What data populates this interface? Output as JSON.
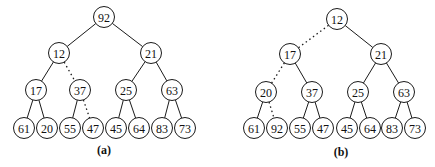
{
  "trees": [
    {
      "id": "a",
      "caption": "(a)",
      "caption_pos": [
        104,
        154
      ],
      "nodes": [
        {
          "value": "92",
          "x": 104,
          "y": 17
        },
        {
          "value": "12",
          "x": 59,
          "y": 53
        },
        {
          "value": "21",
          "x": 151,
          "y": 53
        },
        {
          "value": "17",
          "x": 36,
          "y": 90
        },
        {
          "value": "37",
          "x": 80,
          "y": 90
        },
        {
          "value": "25",
          "x": 126,
          "y": 90
        },
        {
          "value": "63",
          "x": 172,
          "y": 90
        },
        {
          "value": "61",
          "x": 24,
          "y": 128
        },
        {
          "value": "20",
          "x": 47,
          "y": 128
        },
        {
          "value": "55",
          "x": 70,
          "y": 128
        },
        {
          "value": "47",
          "x": 93,
          "y": 128
        },
        {
          "value": "45",
          "x": 116,
          "y": 128
        },
        {
          "value": "64",
          "x": 139,
          "y": 128
        },
        {
          "value": "83",
          "x": 162,
          "y": 128
        },
        {
          "value": "73",
          "x": 185,
          "y": 128
        }
      ],
      "edges": [
        {
          "from": 0,
          "to": 1,
          "dashed": false
        },
        {
          "from": 0,
          "to": 2,
          "dashed": false
        },
        {
          "from": 1,
          "to": 3,
          "dashed": false
        },
        {
          "from": 1,
          "to": 4,
          "dashed": true
        },
        {
          "from": 2,
          "to": 5,
          "dashed": false
        },
        {
          "from": 2,
          "to": 6,
          "dashed": false
        },
        {
          "from": 3,
          "to": 7,
          "dashed": false
        },
        {
          "from": 3,
          "to": 8,
          "dashed": false
        },
        {
          "from": 4,
          "to": 9,
          "dashed": false
        },
        {
          "from": 4,
          "to": 10,
          "dashed": true
        },
        {
          "from": 5,
          "to": 11,
          "dashed": false
        },
        {
          "from": 5,
          "to": 12,
          "dashed": false
        },
        {
          "from": 6,
          "to": 13,
          "dashed": false
        },
        {
          "from": 6,
          "to": 14,
          "dashed": false
        }
      ]
    },
    {
      "id": "b",
      "caption": "(b)",
      "caption_pos": [
        341,
        156
      ],
      "nodes": [
        {
          "value": "12",
          "x": 337,
          "y": 19
        },
        {
          "value": "17",
          "x": 290,
          "y": 54
        },
        {
          "value": "21",
          "x": 381,
          "y": 54
        },
        {
          "value": "20",
          "x": 266,
          "y": 92
        },
        {
          "value": "37",
          "x": 312,
          "y": 92
        },
        {
          "value": "25",
          "x": 358,
          "y": 92
        },
        {
          "value": "63",
          "x": 404,
          "y": 92
        },
        {
          "value": "61",
          "x": 254,
          "y": 128
        },
        {
          "value": "92",
          "x": 277,
          "y": 128
        },
        {
          "value": "55",
          "x": 300,
          "y": 128
        },
        {
          "value": "47",
          "x": 323,
          "y": 128
        },
        {
          "value": "45",
          "x": 347,
          "y": 128
        },
        {
          "value": "64",
          "x": 370,
          "y": 128
        },
        {
          "value": "83",
          "x": 392,
          "y": 128
        },
        {
          "value": "73",
          "x": 415,
          "y": 128
        }
      ],
      "edges": [
        {
          "from": 0,
          "to": 1,
          "dashed": true
        },
        {
          "from": 0,
          "to": 2,
          "dashed": false
        },
        {
          "from": 1,
          "to": 3,
          "dashed": true
        },
        {
          "from": 1,
          "to": 4,
          "dashed": false
        },
        {
          "from": 2,
          "to": 5,
          "dashed": false
        },
        {
          "from": 2,
          "to": 6,
          "dashed": false
        },
        {
          "from": 3,
          "to": 7,
          "dashed": false
        },
        {
          "from": 3,
          "to": 8,
          "dashed": true
        },
        {
          "from": 4,
          "to": 9,
          "dashed": false
        },
        {
          "from": 4,
          "to": 10,
          "dashed": false
        },
        {
          "from": 5,
          "to": 11,
          "dashed": false
        },
        {
          "from": 5,
          "to": 12,
          "dashed": false
        },
        {
          "from": 6,
          "to": 13,
          "dashed": false
        },
        {
          "from": 6,
          "to": 14,
          "dashed": false
        }
      ]
    }
  ],
  "style": {
    "node_radius": 10.5,
    "stroke_color": "#1a1a1a",
    "background": "#ffffff"
  }
}
